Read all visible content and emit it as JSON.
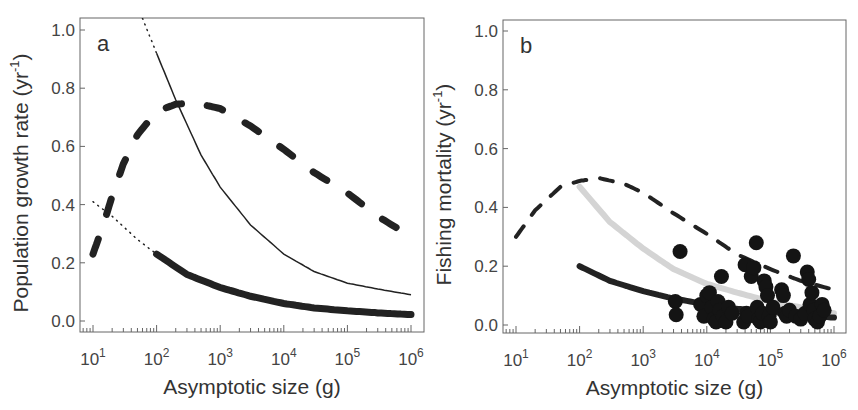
{
  "chart_data": [
    {
      "type": "line",
      "panel_label": "a",
      "title": "",
      "xlabel": "Asymptotic size (g)",
      "ylabel": "Population growth rate (yr^-1)",
      "xscale": "log",
      "xlim": [
        10,
        1000000
      ],
      "ylim": [
        0.0,
        1.0
      ],
      "xticks": [
        "10^1",
        "10^2",
        "10^3",
        "10^4",
        "10^5",
        "10^6"
      ],
      "yticks": [
        "0.0",
        "0.2",
        "0.4",
        "0.6",
        "0.8",
        "1.0"
      ],
      "grid": false,
      "legend": null,
      "series": [
        {
          "name": "thin solid (dotted below 10^2)",
          "style": "thin-solid",
          "x": [
            60,
            100,
            200,
            500,
            1000,
            3000,
            10000,
            30000,
            100000,
            300000,
            1000000
          ],
          "y": [
            1.04,
            0.92,
            0.76,
            0.57,
            0.46,
            0.33,
            0.23,
            0.17,
            0.13,
            0.11,
            0.09
          ]
        },
        {
          "name": "thick dashed",
          "style": "thick-dashed",
          "x": [
            10,
            15,
            20,
            30,
            50,
            100,
            200,
            400,
            1000,
            3000,
            10000,
            30000,
            100000,
            300000,
            1000000
          ],
          "y": [
            0.23,
            0.34,
            0.43,
            0.54,
            0.64,
            0.72,
            0.745,
            0.75,
            0.73,
            0.67,
            0.59,
            0.51,
            0.44,
            0.36,
            0.29
          ]
        },
        {
          "name": "thick solid (dotted below 10^2)",
          "style": "thick-solid",
          "x": [
            10,
            20,
            50,
            100,
            300,
            1000,
            3000,
            10000,
            30000,
            100000,
            300000,
            1000000
          ],
          "y": [
            0.41,
            0.36,
            0.28,
            0.23,
            0.16,
            0.115,
            0.085,
            0.06,
            0.045,
            0.035,
            0.028,
            0.022
          ]
        }
      ]
    },
    {
      "type": "line+scatter",
      "panel_label": "b",
      "title": "",
      "xlabel": "Asymptotic size (g)",
      "ylabel": "Fishing mortality (yr^-1)",
      "xscale": "log",
      "xlim": [
        10,
        1000000
      ],
      "ylim": [
        0.0,
        1.0
      ],
      "xticks": [
        "10^1",
        "10^2",
        "10^3",
        "10^4",
        "10^5",
        "10^6"
      ],
      "yticks": [
        "0.0",
        "0.2",
        "0.4",
        "0.6",
        "0.8",
        "1.0"
      ],
      "grid": false,
      "legend": null,
      "series": [
        {
          "name": "dashed",
          "style": "dashed",
          "x": [
            10,
            20,
            50,
            100,
            200,
            500,
            1000,
            3000,
            10000,
            30000,
            100000,
            300000,
            1000000
          ],
          "y": [
            0.3,
            0.39,
            0.47,
            0.49,
            0.5,
            0.48,
            0.45,
            0.38,
            0.31,
            0.24,
            0.19,
            0.15,
            0.12
          ]
        },
        {
          "name": "grey thick",
          "style": "grey-thick",
          "x": [
            100,
            300,
            1000,
            3000,
            10000,
            30000,
            100000,
            300000,
            1000000
          ],
          "y": [
            0.47,
            0.35,
            0.26,
            0.19,
            0.14,
            0.11,
            0.08,
            0.06,
            0.04
          ]
        },
        {
          "name": "black thick",
          "style": "black-thick",
          "x": [
            100,
            300,
            1000,
            3000,
            10000,
            30000,
            100000,
            300000,
            1000000
          ],
          "y": [
            0.2,
            0.15,
            0.115,
            0.09,
            0.07,
            0.055,
            0.045,
            0.035,
            0.025
          ]
        },
        {
          "name": "observed stocks",
          "style": "scatter",
          "x": [
            3200,
            3300,
            3800,
            8000,
            9000,
            10000,
            11000,
            12000,
            13000,
            14000,
            15000,
            16000,
            17000,
            18000,
            20000,
            22000,
            25000,
            38000,
            40000,
            42000,
            45000,
            50000,
            55000,
            60000,
            62000,
            65000,
            70000,
            75000,
            80000,
            85000,
            90000,
            95000,
            100000,
            110000,
            150000,
            160000,
            170000,
            180000,
            200000,
            230000,
            250000,
            300000,
            350000,
            380000,
            400000,
            420000,
            450000,
            480000,
            500000,
            550000,
            600000,
            650000,
            700000
          ],
          "y": [
            0.08,
            0.035,
            0.25,
            0.07,
            0.03,
            0.1,
            0.11,
            0.06,
            0.02,
            0.01,
            0.08,
            0.05,
            0.165,
            0.03,
            0.01,
            0.06,
            0.04,
            0.01,
            0.205,
            0.04,
            0.03,
            0.165,
            0.195,
            0.28,
            0.06,
            0.02,
            0.01,
            0.04,
            0.15,
            0.13,
            0.1,
            0.03,
            0.01,
            0.06,
            0.12,
            0.1,
            0.04,
            0.03,
            0.05,
            0.235,
            0.03,
            0.02,
            0.04,
            0.18,
            0.155,
            0.07,
            0.11,
            0.05,
            0.02,
            0.01,
            0.03,
            0.07,
            0.05
          ]
        }
      ]
    }
  ],
  "panels": {
    "a": {
      "label": "a",
      "xlabel": "Asymptotic size (g)",
      "ylabel_main": "Population growth rate (yr",
      "ylabel_sup": "-1",
      "ylabel_end": ")"
    },
    "b": {
      "label": "b",
      "xlabel": "Asymptotic size (g)",
      "ylabel_main": "Fishing mortality (yr",
      "ylabel_sup": "-1",
      "ylabel_end": ")"
    }
  },
  "ticks": {
    "y": [
      "0.0",
      "0.2",
      "0.4",
      "0.6",
      "0.8",
      "1.0"
    ],
    "x_base": "10",
    "x_exp": [
      "1",
      "2",
      "3",
      "4",
      "5",
      "6"
    ]
  },
  "colors": {
    "axis": "#666666",
    "line_dark": "#222222",
    "line_grey": "#d4d4d4",
    "points": "#141414"
  }
}
